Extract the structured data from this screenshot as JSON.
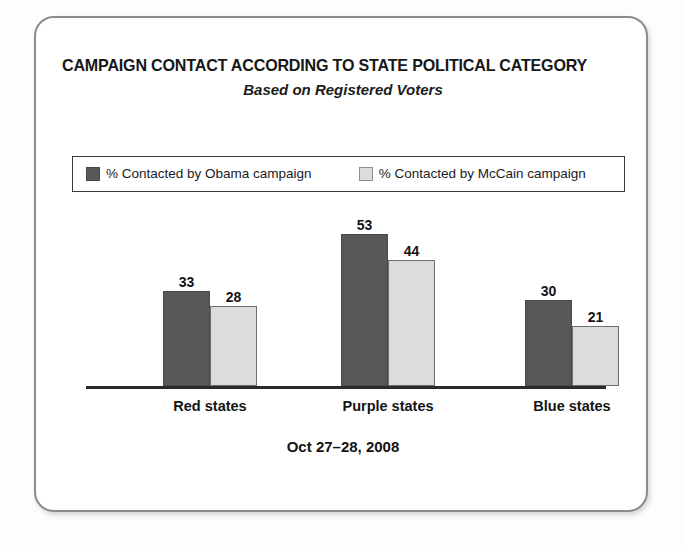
{
  "card": {
    "title": "CAMPAIGN CONTACT ACCORDING TO STATE POLITICAL CATEGORY",
    "subtitle": "Based on Registered Voters",
    "footer_date": "Oct 27–28, 2008"
  },
  "legend": {
    "items": [
      {
        "label": "% Contacted by Obama campaign",
        "color": "#585858",
        "swatch": "dark-swatch"
      },
      {
        "label": "% Contacted by McCain campaign",
        "color": "#dcdcdc",
        "swatch": "light-swatch"
      }
    ]
  },
  "chart_data": {
    "type": "bar",
    "title": "CAMPAIGN CONTACT ACCORDING TO STATE POLITICAL CATEGORY",
    "subtitle": "Based on Registered Voters",
    "note": "Oct 27–28, 2008",
    "xlabel": "",
    "ylabel": "",
    "ylim": [
      0,
      60
    ],
    "grid": false,
    "axis_line": true,
    "legend_position": "top",
    "value_labels": true,
    "categories": [
      "Red states",
      "Purple states",
      "Blue states"
    ],
    "series": [
      {
        "name": "% Contacted by Obama campaign",
        "color": "#585858",
        "values": [
          33,
          53,
          30
        ]
      },
      {
        "name": "% Contacted by McCain campaign",
        "color": "#dcdcdc",
        "values": [
          28,
          44,
          21
        ]
      }
    ]
  }
}
